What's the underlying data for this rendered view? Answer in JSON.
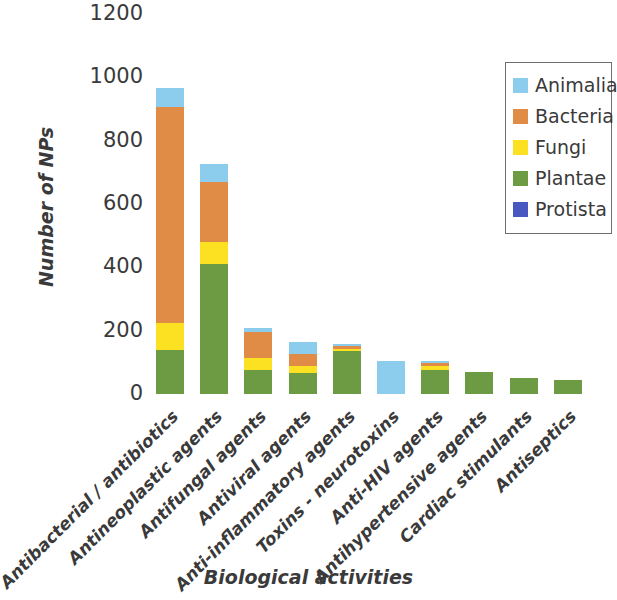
{
  "chart_data": {
    "type": "bar",
    "subtype": "stacked-bar",
    "title": "",
    "xlabel": "Biological activities",
    "ylabel": "Number of NPs",
    "ylim": [
      0,
      1200
    ],
    "ytick_values": [
      1200,
      1000,
      800,
      600,
      400,
      200,
      0
    ],
    "ytick_labels": [
      "1200",
      "1000",
      "800",
      "600",
      "400",
      "200",
      "0"
    ],
    "grid": false,
    "legend_position": "top-right",
    "categories": [
      "Antibacterial / antibiotics",
      "Antineoplastic agents",
      "Antifungal agents",
      "Antiviral agents",
      "Anti-inflammatory agents",
      "Toxins - neurotoxins",
      "Anti-HIV agents",
      "Antihypertensive agents",
      "Cardiac stimulants",
      "Antiseptics"
    ],
    "series": [
      {
        "name": "Plantae",
        "color": "#6d9b43",
        "values": [
          140,
          410,
          75,
          65,
          135,
          0,
          75,
          70,
          50,
          45
        ]
      },
      {
        "name": "Fungi",
        "color": "#fbe122",
        "values": [
          85,
          70,
          40,
          25,
          8,
          0,
          12,
          0,
          0,
          0
        ]
      },
      {
        "name": "Bacteria",
        "color": "#e08b46",
        "values": [
          680,
          190,
          80,
          35,
          8,
          0,
          10,
          0,
          0,
          0
        ]
      },
      {
        "name": "Animalia",
        "color": "#8ccdee",
        "values": [
          60,
          55,
          12,
          38,
          8,
          105,
          8,
          0,
          0,
          0
        ]
      },
      {
        "name": "Protista",
        "color": "#4858c0",
        "values": [
          0,
          0,
          0,
          0,
          0,
          0,
          0,
          0,
          0,
          0
        ]
      }
    ],
    "totals": [
      965,
      725,
      207,
      163,
      159,
      105,
      105,
      70,
      50,
      45
    ],
    "stack_order_bottom_to_top": [
      "Plantae",
      "Fungi",
      "Bacteria",
      "Animalia",
      "Protista"
    ]
  },
  "legend": {
    "entries": [
      {
        "label": "Animalia",
        "color": "#8ccdee"
      },
      {
        "label": "Bacteria",
        "color": "#e08b46"
      },
      {
        "label": "Fungi",
        "color": "#fbe122"
      },
      {
        "label": "Plantae",
        "color": "#6d9b43"
      },
      {
        "label": "Protista",
        "color": "#4858c0"
      }
    ]
  },
  "axes": {
    "y_title": "Number of NPs",
    "x_title": "Biological activities"
  }
}
